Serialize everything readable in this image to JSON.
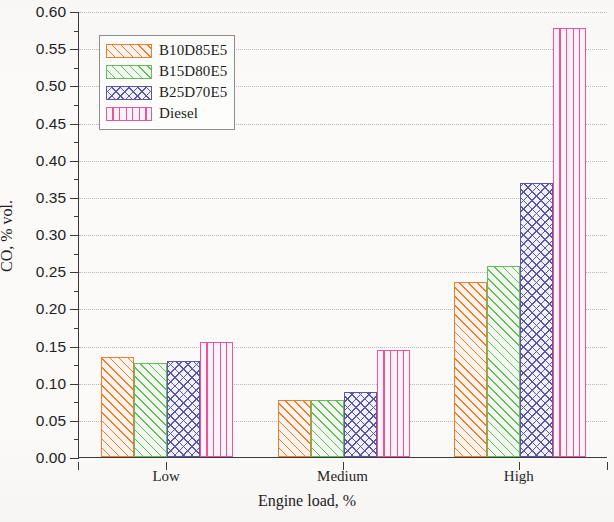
{
  "chart_data": {
    "type": "bar",
    "title": "",
    "xlabel": "Engine load, %",
    "ylabel": "CO, % vol.",
    "categories": [
      "Low",
      "Medium",
      "High"
    ],
    "series": [
      {
        "name": "B10D85E5",
        "values": [
          0.134,
          0.077,
          0.235
        ],
        "color": "#ED7D31",
        "hatch": "diagonal",
        "fill": "#FBF3EC"
      },
      {
        "name": "B15D80E5",
        "values": [
          0.126,
          0.077,
          0.257
        ],
        "color": "#66BB5C",
        "hatch": "diagonal",
        "fill": "#F2F8F0"
      },
      {
        "name": "B25D70E5",
        "values": [
          0.129,
          0.088,
          0.368
        ],
        "color": "#5B57A8",
        "hatch": "cross",
        "fill": "#F1F1F8"
      },
      {
        "name": "Diesel",
        "values": [
          0.155,
          0.144,
          0.577
        ],
        "color": "#E8559B",
        "hatch": "vertical",
        "fill": "#FCF2F7"
      }
    ],
    "ylim": [
      0.0,
      0.6
    ],
    "ytick_step": 0.05,
    "yticks": [
      "0.00",
      "0.05",
      "0.10",
      "0.15",
      "0.20",
      "0.25",
      "0.30",
      "0.35",
      "0.40",
      "0.45",
      "0.50",
      "0.55",
      "0.60"
    ],
    "grid": true,
    "grid_axis": "y",
    "grid_style": "dotted",
    "legend_position": "upper left inside",
    "minor_ticks": true
  },
  "axis": {
    "y_title": "CO, % vol.",
    "x_title": "Engine load, %"
  },
  "legend": {
    "items": [
      {
        "label": "B10D85E5"
      },
      {
        "label": "B15D80E5"
      },
      {
        "label": "B25D70E5"
      },
      {
        "label": "Diesel"
      }
    ]
  }
}
